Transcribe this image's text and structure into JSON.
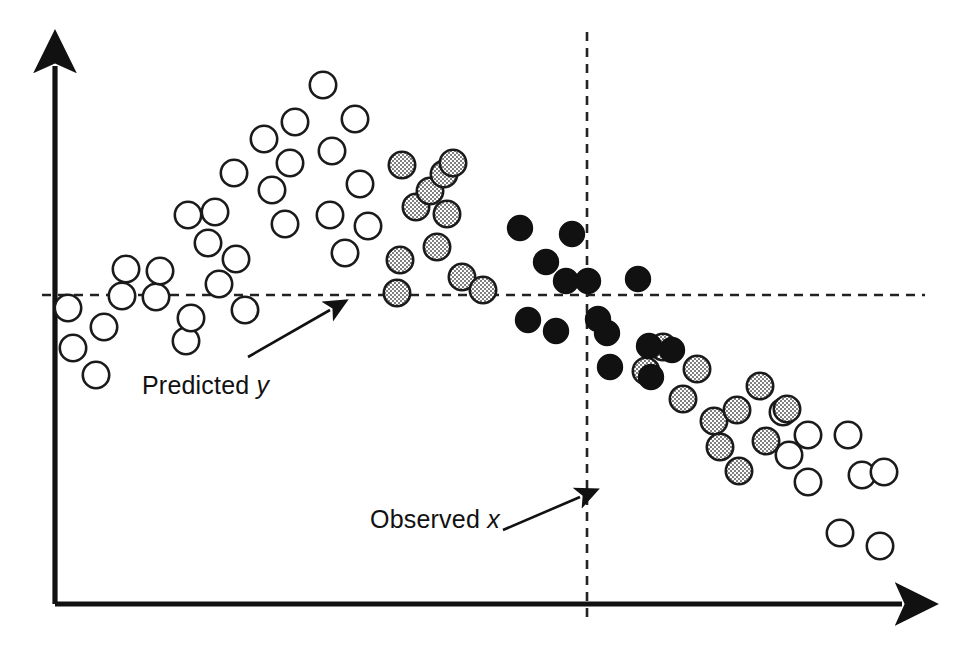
{
  "figure": {
    "background": "#ffffff",
    "ink": "#111111",
    "width": 958,
    "height": 663
  },
  "annotations": {
    "predicted": {
      "text_prefix": "Predicted ",
      "variable": "y",
      "full": "Predicted y"
    },
    "observed": {
      "text_prefix": "Observed ",
      "variable": "x",
      "full": "Observed x"
    }
  },
  "axes": {
    "y_axis": {
      "name": "y-axis",
      "x": 55,
      "y_top": 57,
      "y_bottom": 604,
      "arrow": "up"
    },
    "x_axis": {
      "name": "x-axis",
      "y": 604,
      "x_left": 55,
      "x_right": 912,
      "arrow": "right"
    },
    "h_reference": {
      "name": "predicted-y-reference",
      "y": 295,
      "x_start": 42,
      "x_end": 925,
      "style": "dashed"
    },
    "v_reference": {
      "name": "observed-x-reference",
      "x": 587,
      "y_start": 32,
      "y_end": 620,
      "style": "dashed"
    }
  },
  "marker_styles": {
    "open": {
      "fill": "#ffffff",
      "stroke": "#1a1a1a",
      "label": "open-circle"
    },
    "stipple": {
      "fill": "#d8d8d8",
      "stroke": "#1a1a1a",
      "label": "stippled-circle"
    },
    "solid": {
      "fill": "#111111",
      "stroke": "#111111",
      "label": "solid-circle"
    }
  },
  "chart_data": {
    "type": "scatter",
    "title": "",
    "xlabel": "Observed x",
    "ylabel": "Predicted y",
    "grid": false,
    "legend": "none",
    "xlim": [
      0,
      958
    ],
    "ylim": [
      0,
      663
    ],
    "reference_lines": [
      {
        "orientation": "horizontal",
        "value": 295,
        "label": "Predicted y",
        "style": "dashed"
      },
      {
        "orientation": "vertical",
        "value": 587,
        "label": "Observed x",
        "style": "dashed"
      }
    ],
    "series": [
      {
        "name": "open",
        "marker": "open-circle",
        "count": 37,
        "points": [
          [
            68,
            308
          ],
          [
            73,
            348
          ],
          [
            96,
            375
          ],
          [
            104,
            327
          ],
          [
            122,
            296
          ],
          [
            126,
            269
          ],
          [
            156,
            297
          ],
          [
            160,
            271
          ],
          [
            186,
            341
          ],
          [
            191,
            318
          ],
          [
            188,
            215
          ],
          [
            208,
            243
          ],
          [
            215,
            212
          ],
          [
            219,
            284
          ],
          [
            234,
            173
          ],
          [
            236,
            259
          ],
          [
            245,
            310
          ],
          [
            264,
            139
          ],
          [
            272,
            190
          ],
          [
            285,
            224
          ],
          [
            290,
            163
          ],
          [
            295,
            122
          ],
          [
            323,
            85
          ],
          [
            330,
            215
          ],
          [
            332,
            151
          ],
          [
            345,
            253
          ],
          [
            355,
            119
          ],
          [
            360,
            184
          ],
          [
            368,
            226
          ],
          [
            783,
            412
          ],
          [
            808,
            435
          ],
          [
            848,
            435
          ],
          [
            789,
            455
          ],
          [
            808,
            482
          ],
          [
            862,
            475
          ],
          [
            884,
            472
          ],
          [
            840,
            533
          ],
          [
            880,
            546
          ]
        ]
      },
      {
        "name": "stipple",
        "marker": "stippled-circle",
        "count": 22,
        "points": [
          [
            397,
            293
          ],
          [
            400,
            260
          ],
          [
            402,
            165
          ],
          [
            416,
            207
          ],
          [
            430,
            191
          ],
          [
            437,
            247
          ],
          [
            444,
            174
          ],
          [
            447,
            214
          ],
          [
            453,
            163
          ],
          [
            462,
            277
          ],
          [
            483,
            290
          ],
          [
            646,
            371
          ],
          [
            663,
            347
          ],
          [
            683,
            399
          ],
          [
            697,
            369
          ],
          [
            714,
            421
          ],
          [
            720,
            447
          ],
          [
            737,
            410
          ],
          [
            739,
            471
          ],
          [
            760,
            386
          ],
          [
            766,
            441
          ],
          [
            787,
            409
          ]
        ]
      },
      {
        "name": "solid",
        "marker": "solid-circle",
        "count": 18,
        "points": [
          [
            520,
            228
          ],
          [
            528,
            320
          ],
          [
            546,
            262
          ],
          [
            556,
            331
          ],
          [
            572,
            234
          ],
          [
            566,
            281
          ],
          [
            588,
            281
          ],
          [
            607,
            333
          ],
          [
            610,
            367
          ],
          [
            638,
            279
          ],
          [
            649,
            346
          ],
          [
            651,
            377
          ],
          [
            672,
            350
          ],
          [
            598,
            319
          ]
        ]
      }
    ]
  }
}
